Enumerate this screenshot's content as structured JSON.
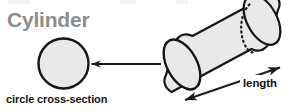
{
  "figure": {
    "title": "Cylinder",
    "caption": "circle cross-section",
    "dimension_label": "length",
    "width_px": 293,
    "height_px": 111,
    "background_color": "#ffffff",
    "title_color": "#8d8d8d",
    "text_color": "#171717",
    "shape_fill": "#e9e9e9",
    "shape_stroke": "#1a1a1a",
    "arrow_color": "#1a1a1a",
    "hidden_edge_style": "dashed"
  },
  "shapes": {
    "cross_section_circle": {
      "name": "circle",
      "center_x": 63.5,
      "center_y": 63.5,
      "radius": 25.5
    },
    "cylinder": {
      "name": "cylinder",
      "near_face": {
        "center_x": 182,
        "center_y": 64,
        "rx": 15,
        "ry": 27,
        "rotation_deg": -28
      },
      "far_face": {
        "center_x": 262,
        "center_y": 21,
        "rx": 15,
        "ry": 27,
        "rotation_deg": -28
      }
    }
  },
  "annotations": {
    "pointer_arrow": {
      "name": "cross-section-pointer",
      "from_x": 162,
      "from_y": 64,
      "to_x": 90,
      "to_y": 64,
      "heads": 1,
      "direction": "left"
    },
    "length_arrow": {
      "name": "length-dimension",
      "from_x": 183,
      "from_y": 101,
      "to_x": 281,
      "to_y": 67,
      "heads": 2,
      "direction": "both"
    }
  }
}
